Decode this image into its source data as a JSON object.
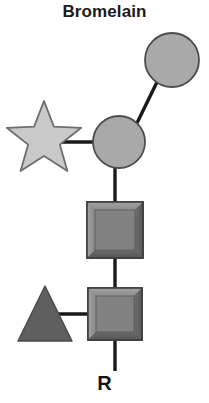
{
  "title": "Bromelain",
  "terminal_label": "R",
  "colors": {
    "background": "#ffffff",
    "text": "#1a1a1a",
    "bond": "#1a1a1a",
    "circle_fill": "#a9a9a9",
    "circle_stroke": "#4d4d4d",
    "star_fill": "#c9c9c9",
    "star_stroke": "#6e6e6e",
    "square_fill": "#7e7e7e",
    "square_stroke": "#3d3d3d",
    "square_bevel_light": "#9a9a9a",
    "square_bevel_dark": "#5c5c5c",
    "triangle_fill": "#5f5f5f",
    "triangle_stroke": "#4a4a4a"
  },
  "diagram": {
    "type": "glycan-symbol-structure",
    "nodes": [
      {
        "id": "mannose-upper",
        "shape": "circle",
        "symbol_name": "mannose-circle",
        "cx": 172,
        "cy": 60,
        "r": 27,
        "fill": "#a9a9a9"
      },
      {
        "id": "mannose-core",
        "shape": "circle",
        "symbol_name": "mannose-circle",
        "cx": 119,
        "cy": 142,
        "r": 26,
        "fill": "#a9a9a9"
      },
      {
        "id": "xylose",
        "shape": "star",
        "symbol_name": "xylose-star",
        "cx": 44,
        "cy": 135,
        "r": 34,
        "fill": "#c9c9c9"
      },
      {
        "id": "glcnac-upper",
        "shape": "square",
        "symbol_name": "glcnac-square",
        "cx": 115,
        "cy": 230,
        "size": 56,
        "fill": "#7e7e7e"
      },
      {
        "id": "glcnac-lower",
        "shape": "square",
        "symbol_name": "glcnac-square",
        "cx": 115,
        "cy": 314,
        "size": 54,
        "fill": "#7e7e7e"
      },
      {
        "id": "fucose",
        "shape": "triangle",
        "symbol_name": "fucose-triangle",
        "cx": 45,
        "cy": 314,
        "size": 54,
        "fill": "#5f5f5f"
      }
    ],
    "bonds": [
      {
        "id": "bond-mannose-upper",
        "from": "mannose-core",
        "to": "mannose-upper",
        "x1": 137,
        "y1": 123,
        "x2": 156,
        "y2": 82
      },
      {
        "id": "bond-xylose",
        "from": "xylose",
        "to": "mannose-core",
        "x1": 62,
        "y1": 142,
        "x2": 94,
        "y2": 142
      },
      {
        "id": "bond-core-glcnac",
        "from": "mannose-core",
        "to": "glcnac-upper",
        "x1": 115,
        "y1": 168,
        "x2": 115,
        "y2": 203
      },
      {
        "id": "bond-glcnac-glcnac",
        "from": "glcnac-upper",
        "to": "glcnac-lower",
        "x1": 115,
        "y1": 258,
        "x2": 115,
        "y2": 288
      },
      {
        "id": "bond-fucose",
        "from": "fucose",
        "to": "glcnac-lower",
        "x1": 56,
        "y1": 314,
        "x2": 89,
        "y2": 314
      },
      {
        "id": "bond-terminal",
        "from": "glcnac-lower",
        "to": "R",
        "x1": 115,
        "y1": 340,
        "x2": 115,
        "y2": 372
      }
    ]
  }
}
